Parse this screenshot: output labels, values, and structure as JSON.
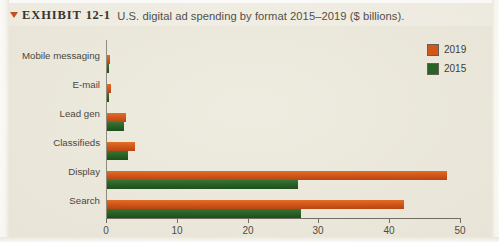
{
  "caption": {
    "marker": "triangle-down-marker",
    "label": "EXHIBIT",
    "number": "12-1",
    "text": "U.S. digital ad spending by format 2015–2019 ($ billions)."
  },
  "legend": {
    "position": "top-right",
    "items": [
      {
        "name": "2019",
        "color": "#d4500f"
      },
      {
        "name": "2015",
        "color": "#1d5c1e"
      }
    ]
  },
  "axis": {
    "x_ticks": [
      "0",
      "10",
      "20",
      "30",
      "40",
      "50"
    ],
    "x_tick_values": [
      0,
      10,
      20,
      30,
      40,
      50
    ],
    "x_min": 0,
    "x_max": 50
  },
  "colors": {
    "series_2019": "#d4500f",
    "series_2015": "#1d5c1e",
    "panel_background": "#edeade",
    "page_background": "#f2efe6",
    "axis": "#6c6a5e",
    "caption_marker": "#c44a1c"
  },
  "chart_data": {
    "type": "bar",
    "orientation": "horizontal",
    "title": "U.S. digital ad spending by format 2015–2019 ($ billions)",
    "xlabel": "",
    "ylabel": "",
    "xlim": [
      0,
      50
    ],
    "grid": false,
    "legend_position": "top-right",
    "categories": [
      "Mobile messaging",
      "E-mail",
      "Lead gen",
      "Classifieds",
      "Display",
      "Search"
    ],
    "series": [
      {
        "name": "2019",
        "color": "#d4500f",
        "values": [
          0.4,
          0.5,
          2.7,
          4.0,
          48.0,
          42.0
        ]
      },
      {
        "name": "2015",
        "color": "#1d5c1e",
        "values": [
          0.3,
          0.3,
          2.4,
          3.0,
          27.0,
          27.4
        ]
      }
    ]
  }
}
